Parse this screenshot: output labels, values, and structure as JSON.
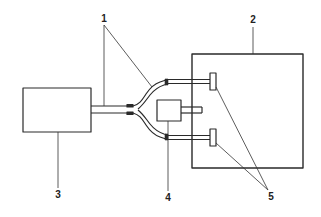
{
  "diagram": {
    "type": "schematic",
    "colors": {
      "stroke": "#2a2a2a",
      "background": "#ffffff"
    },
    "labels": [
      {
        "id": "1",
        "text": "1",
        "x": 104,
        "y": 19
      },
      {
        "id": "2",
        "text": "2",
        "x": 253,
        "y": 20
      },
      {
        "id": "3",
        "text": "3",
        "x": 58,
        "y": 195
      },
      {
        "id": "4",
        "text": "4",
        "x": 168,
        "y": 198
      },
      {
        "id": "5",
        "text": "5",
        "x": 271,
        "y": 197
      }
    ],
    "components": [
      {
        "ref": "1",
        "name": "bifurcated cable / light guide",
        "shape": "branching tube"
      },
      {
        "ref": "2",
        "name": "enclosure",
        "shape": "large rectangle"
      },
      {
        "ref": "3",
        "name": "source unit",
        "shape": "rectangle"
      },
      {
        "ref": "4",
        "name": "junction block",
        "shape": "small rectangle with stub"
      },
      {
        "ref": "5",
        "name": "end connectors",
        "shape": "two small terminal blocks"
      }
    ]
  }
}
